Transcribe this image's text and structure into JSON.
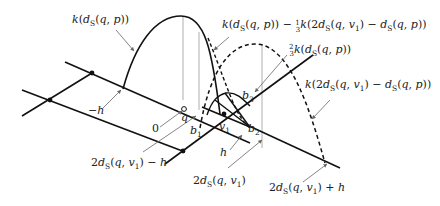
{
  "figure": {
    "type": "mathematical-diagram",
    "labels": {
      "curve_main": "k(d_S(q,p))",
      "curve_combined": "k(d_S(q,p)) − 1/3 k(2d_S(q,v_1) − d_S(q,p))",
      "curve_two_thirds": "2/3 k(d_S(q,p))",
      "curve_reflected": "k(2d_S(q,v_1) − d_S(q,p))",
      "mark_neg_h": "−h",
      "mark_zero": "0",
      "mark_q": "q",
      "mark_v1": "v1",
      "mark_b1": "b1",
      "mark_b2": "b2",
      "mark_b3": "b3",
      "mark_h": "h",
      "mark_2d_minus_h": "2d_S(q,v_1) − h",
      "mark_2d": "2d_S(q,v_1)",
      "mark_2d_plus_h": "2d_S(q,v_1) + h"
    },
    "text": {
      "k": "k",
      "open": "(",
      "close": ")",
      "d": "d",
      "S": "S",
      "q": "q",
      "p": "p",
      "v": "v",
      "one": "1",
      "two": "2",
      "three": "3",
      "comma": ", ",
      "minus": " − ",
      "plus": " + ",
      "h": "h",
      "neg_h": "−h",
      "zero": "0",
      "b": "b"
    }
  }
}
